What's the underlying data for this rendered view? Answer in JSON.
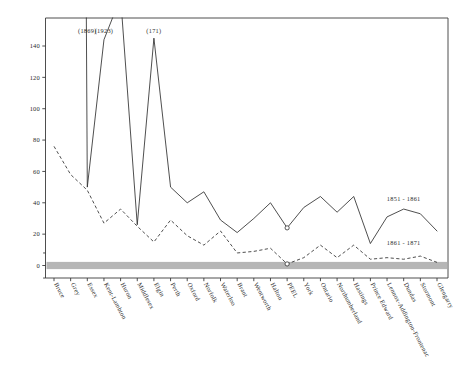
{
  "chart_data": {
    "type": "line",
    "title": "",
    "subtitle": "",
    "xlabel": "",
    "ylabel": "",
    "ylim": [
      -10,
      150
    ],
    "yticks": [
      0,
      20,
      40,
      60,
      80,
      100,
      120,
      140
    ],
    "ytick_labels": [
      "0",
      "20",
      "40",
      "60",
      "80",
      "100",
      "120",
      "140"
    ],
    "grid": false,
    "legend_position": "inline-annotation",
    "categories": [
      "Bruce",
      "Grey",
      "Essex",
      "Kent-Lambton",
      "Huron",
      "Middlesex",
      "Elgin",
      "Perth",
      "Oxford",
      "Norfolk",
      "Waterloo",
      "Brant",
      "Wentworth",
      "Halton",
      "PEEL",
      "York",
      "Ontario",
      "Northumberland",
      "Hastings",
      "Prince Edward",
      "Lennox-Addington-Frontenac",
      "Dundas",
      "Stormont",
      "Glengarry"
    ],
    "series": [
      {
        "name": "1851 - 1861",
        "style": "solid",
        "values": [
          1869,
          1923,
          50,
          144,
          171,
          26,
          145,
          50,
          40,
          47,
          29,
          21,
          30,
          40,
          24,
          37,
          44,
          34,
          44,
          14,
          31,
          36,
          33,
          22
        ],
        "offscale_indices": [
          0,
          1,
          3,
          4,
          6
        ],
        "marker_indices": [
          14
        ]
      },
      {
        "name": "1861 - 1871",
        "style": "dashed",
        "values": [
          76,
          58,
          48,
          27,
          36,
          25,
          15,
          29,
          19,
          13,
          22,
          8,
          9,
          11,
          1,
          5,
          13,
          5,
          13,
          4,
          5,
          4,
          6,
          2
        ],
        "offscale_indices": [],
        "marker_indices": [
          14
        ]
      }
    ],
    "annotations": [
      {
        "text": "(1869)",
        "x_category": "Essex",
        "y": 148
      },
      {
        "text": "(1923)",
        "x_category": "Kent-Lambton",
        "y": 148
      },
      {
        "text": "(171)",
        "x_category": "Elgin",
        "y": 148
      },
      {
        "text": "1851 - 1861",
        "x_category": "Dundas",
        "y": 41
      },
      {
        "text": "1861 - 1871",
        "x_category": "Dundas",
        "y": 13
      }
    ],
    "reference_band": {
      "label": "",
      "y_center": 0,
      "color": "#9a9a9a"
    },
    "colors": {
      "line": "#2f2f2f",
      "band": "#9a9a9a",
      "axis": "#3a3a3a",
      "background": "#ffffff"
    }
  }
}
